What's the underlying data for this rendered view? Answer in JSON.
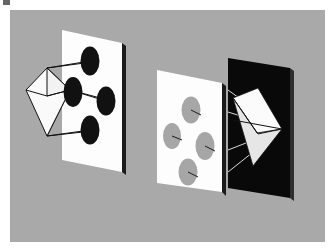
{
  "figure": {
    "caption_mark": "",
    "background_color": "#ffffff",
    "panel_color": "#a9a9a9",
    "panel": {
      "x": 10,
      "y": 10,
      "width": 315,
      "height": 232
    }
  },
  "scene_left": {
    "name": "octahedron-to-white-screen",
    "screen": {
      "name": "white-screen-left",
      "fill": "#fdfdfd",
      "edge_fill": "#1b1b1b",
      "points": "62,30 122,43 122,172 62,160",
      "edge_points": "122,43 126,46 126,175 122,172"
    },
    "solid": {
      "name": "octahedron-left",
      "fill": "#fafafa",
      "stroke": "#111111",
      "front_face": "26,90 47,68 70,90 47,136",
      "top_face": "47,68 70,90 47,96",
      "outline": "26,90 47,68 70,90 47,136"
    },
    "rays": [
      {
        "from_x": 47,
        "from_y": 68,
        "to_x": 88,
        "to_y": 62
      },
      {
        "from_x": 47,
        "from_y": 68,
        "to_x": 70,
        "to_y": 90
      },
      {
        "from_x": 47,
        "from_y": 136,
        "to_x": 88,
        "to_y": 131
      },
      {
        "from_x": 70,
        "from_y": 90,
        "to_x": 112,
        "to_y": 99
      },
      {
        "from_x": 47,
        "from_y": 96,
        "to_x": 70,
        "to_y": 90
      },
      {
        "from_x": 26,
        "from_y": 90,
        "to_x": 47,
        "to_y": 96
      }
    ],
    "ellipses": [
      {
        "name": "shadow-ellipse-top",
        "cx": 88,
        "cy": 62,
        "rx": 9,
        "ry": 14,
        "fill": "#111111"
      },
      {
        "name": "shadow-ellipse-left",
        "cx": 72,
        "cy": 92,
        "rx": 9,
        "ry": 15,
        "fill": "#111111"
      },
      {
        "name": "shadow-ellipse-right",
        "cx": 104,
        "cy": 100,
        "rx": 9,
        "ry": 14,
        "fill": "#111111"
      },
      {
        "name": "shadow-ellipse-bottom",
        "cx": 88,
        "cy": 130,
        "rx": 9,
        "ry": 14,
        "fill": "#111111"
      }
    ]
  },
  "scene_right": {
    "name": "white-screen-to-black-screen",
    "screen_front": {
      "name": "white-screen-right",
      "fill": "#fdfdfd",
      "edge_fill": "#1b1b1b",
      "points": "157,70 222,83 222,192 157,183",
      "edge_points": "222,83 226,86 226,196 222,192"
    },
    "screen_back": {
      "name": "black-screen",
      "fill": "#090909",
      "edge_fill": "#2e2e2e",
      "points": "228,58 290,68 290,198 228,188",
      "edge_points": "290,68 294,71 294,201 290,198"
    },
    "ellipses": [
      {
        "name": "gray-ellipse-top",
        "cx": 191,
        "cy": 110,
        "rx": 9,
        "ry": 13,
        "fill": "#a6a6a6",
        "tick_x2": 200,
        "tick_y2": 115
      },
      {
        "name": "gray-ellipse-left",
        "cx": 172,
        "cy": 136,
        "rx": 9,
        "ry": 13,
        "fill": "#a6a6a6",
        "tick_x2": 181,
        "tick_y2": 140
      },
      {
        "name": "gray-ellipse-right",
        "cx": 205,
        "cy": 146,
        "rx": 9,
        "ry": 14,
        "fill": "#a6a6a6",
        "tick_x2": 214,
        "tick_y2": 150
      },
      {
        "name": "gray-ellipse-bottom",
        "cx": 188,
        "cy": 172,
        "rx": 9,
        "ry": 13,
        "fill": "#a6a6a6",
        "tick_x2": 197,
        "tick_y2": 176
      }
    ],
    "solid": {
      "name": "octahedron-right",
      "fill": "#fbfbfb",
      "fill_shade": "#e6e6e6",
      "stroke": "#111111",
      "top_face": "233,98 258,88 282,129 258,134",
      "bottom_face": "233,98 258,134 282,129 253,166",
      "outline": "258,88 282,129 253,166 233,98"
    },
    "rays": [
      {
        "from_x": 226,
        "from_y": 92,
        "to_x": 282,
        "to_y": 129
      },
      {
        "from_x": 226,
        "from_y": 131,
        "to_x": 282,
        "to_y": 129
      },
      {
        "from_x": 226,
        "from_y": 152,
        "to_x": 282,
        "to_y": 129
      },
      {
        "from_x": 226,
        "from_y": 175,
        "to_x": 282,
        "to_y": 129
      }
    ]
  }
}
